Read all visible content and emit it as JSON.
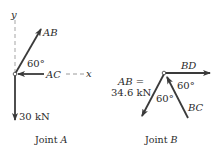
{
  "joint_a": {
    "caption_prefix": "Joint ",
    "caption_letter": "A",
    "axis_y_label": "y",
    "axis_x_label": "x",
    "force_ab_label": "AB",
    "force_ac_label": "AC",
    "angle_label": "60°",
    "load_label": "30 kN"
  },
  "joint_b": {
    "caption_prefix": "Joint ",
    "caption_letter": "B",
    "force_bd_label": "BD",
    "force_bc_label": "BC",
    "force_ab_label_line1": "AB =",
    "force_ab_label_line2": "34.6 kN",
    "angle_label_right": "60°",
    "angle_label_left": "60°"
  },
  "colors": {
    "arrow": "#3a3a3a",
    "axis_dashed": "#b5b5b5",
    "text": "#2a2a2a"
  }
}
